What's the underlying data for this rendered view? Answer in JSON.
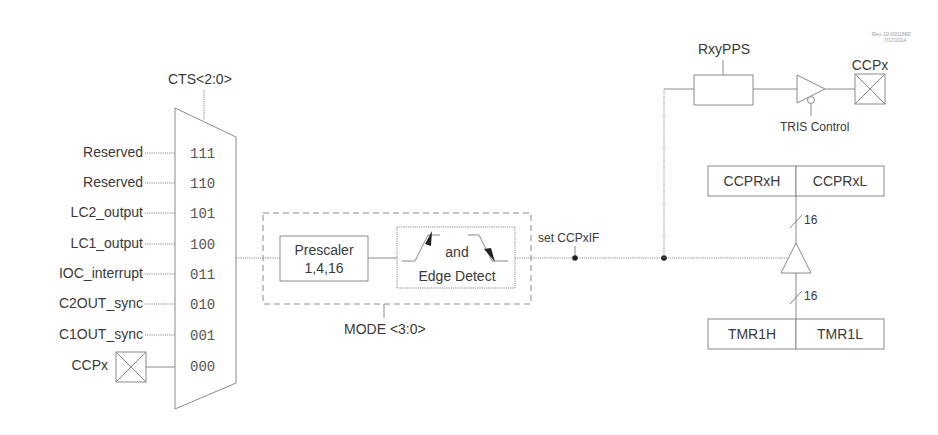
{
  "diagram": {
    "revision": [
      "Rev. 10-000186D",
      "7/17/2014"
    ],
    "mux": {
      "select_label": "CTS<2:0>",
      "inputs": [
        {
          "label": "Reserved",
          "code": "111"
        },
        {
          "label": "Reserved",
          "code": "110"
        },
        {
          "label": "LC2_output",
          "code": "101"
        },
        {
          "label": "LC1_output",
          "code": "100"
        },
        {
          "label": "IOC_interrupt",
          "code": "011"
        },
        {
          "label": "C2OUT_sync",
          "code": "010"
        },
        {
          "label": "C1OUT_sync",
          "code": "001"
        },
        {
          "label": "CCPx",
          "code": "000"
        }
      ]
    },
    "mode_block": {
      "label": "MODE <3:0>",
      "prescaler": {
        "line1": "Prescaler",
        "line2": "1,4,16"
      },
      "edge": {
        "line1": "and",
        "line2": "Edge Detect"
      }
    },
    "signal": {
      "set_flag": "set CCPxIF"
    },
    "output": {
      "pps_label": "RxyPPS",
      "tris_label": "TRIS Control",
      "pin_label": "CCPx"
    },
    "registers": {
      "capture": {
        "high": "CCPRxH",
        "low": "CCPRxL"
      },
      "timer": {
        "high": "TMR1H",
        "low": "TMR1L"
      },
      "bus_width_top": "16",
      "bus_width_bottom": "16"
    }
  }
}
